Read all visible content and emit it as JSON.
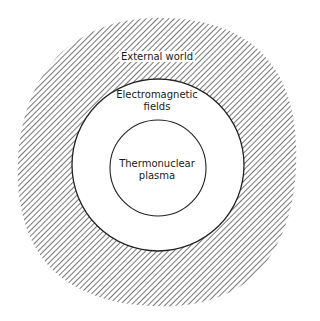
{
  "diagram": {
    "type": "concentric-regions",
    "colors": {
      "background": "#ffffff",
      "hatch": "#555555",
      "line": "#222222",
      "text": "#1a1a1a"
    },
    "regions": [
      {
        "id": "outer",
        "label": "External world",
        "fill": "hatched"
      },
      {
        "id": "middle",
        "label_line1": "Electromagnetic",
        "label_line2": "fields",
        "fill": "white"
      },
      {
        "id": "inner",
        "label_line1": "Thermonuclear",
        "label_line2": "plasma",
        "fill": "white"
      }
    ]
  }
}
